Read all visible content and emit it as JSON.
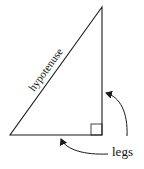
{
  "diagram": {
    "labels": {
      "hypotenuse": "hypotenuse",
      "legs": "legs"
    },
    "colors": {
      "stroke": "#1a1a1a",
      "background": "#ffffff"
    }
  }
}
